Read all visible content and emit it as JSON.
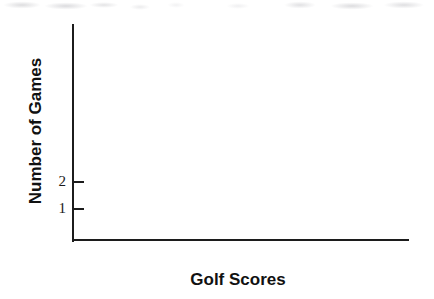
{
  "chart_data": {
    "type": "bar",
    "title": "",
    "subtitle": "",
    "xlabel": "Golf Scores",
    "ylabel": "Number of Games",
    "categories": [],
    "values": [],
    "series": [],
    "x_tick_labels": [],
    "y_tick_labels": [
      "2",
      "1"
    ],
    "y_ticks": [
      2,
      1
    ],
    "ylim": [
      0,
      8
    ],
    "xlim": [
      0,
      1
    ],
    "grid": false,
    "legend": false,
    "legend_position": "none",
    "annotations": []
  },
  "axes": {
    "y_title": "Number of Games",
    "x_title": "Golf Scores",
    "ticks": [
      {
        "label": "2",
        "value": 2
      },
      {
        "label": "1",
        "value": 1
      }
    ]
  },
  "colors": {
    "axis": "#1c1c1c",
    "text": "#111111",
    "tick_text": "#1a1a1a",
    "background": "#ffffff"
  }
}
